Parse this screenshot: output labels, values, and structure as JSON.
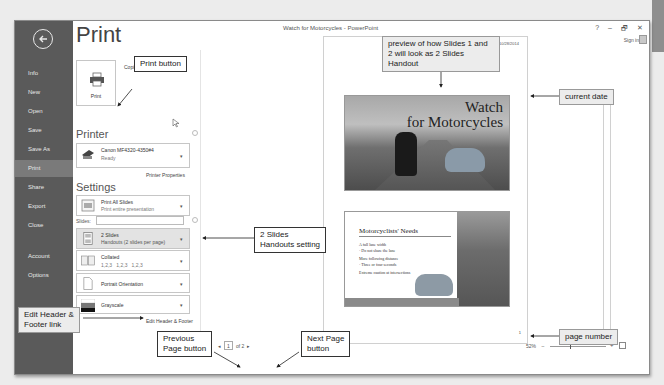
{
  "window": {
    "title": "Watch for Motorcycles - PowerPoint",
    "controls": [
      "?",
      "–",
      "🗗",
      "✕"
    ],
    "sign_in": "Sign in"
  },
  "sidebar": {
    "items": [
      {
        "label": "Info"
      },
      {
        "label": "New"
      },
      {
        "label": "Open"
      },
      {
        "label": "Save"
      },
      {
        "label": "Save As"
      },
      {
        "label": "Print",
        "active": true
      },
      {
        "label": "Share"
      },
      {
        "label": "Export"
      },
      {
        "label": "Close"
      },
      {
        "label": "Account"
      },
      {
        "label": "Options"
      }
    ]
  },
  "print": {
    "title": "Print",
    "button_label": "Print",
    "copies_label": "Copies:",
    "copies_value": "1"
  },
  "printer": {
    "heading": "Printer",
    "name": "Canon MF4320-4350#4",
    "status": "Ready",
    "properties_link": "Printer Properties"
  },
  "settings": {
    "heading": "Settings",
    "print_range": {
      "title": "Print All Slides",
      "subtitle": "Print entire presentation"
    },
    "slides_label": "Slides:",
    "slides_value": "",
    "layout": {
      "title": "2 Slides",
      "subtitle": "Handouts (2 slides per page)"
    },
    "collation": {
      "title": "Collated",
      "subtitle": "1,2,3   1,2,3   1,2,3"
    },
    "orientation": "Portrait Orientation",
    "color": "Grayscale",
    "header_footer_link": "Edit Header & Footer"
  },
  "preview": {
    "date": "10/28/2014",
    "slide1_title_line1": "Watch",
    "slide1_title_line2": "for Motorcycles",
    "slide2_title": "Motorcyclists' Needs",
    "slide2_bullets": [
      "A full lane width",
      "· Do not share the lane",
      "More following distance",
      "· Three or four seconds",
      "Extreme caution at intersections"
    ],
    "page_number": "1"
  },
  "pager": {
    "prev": "◂",
    "current": "1",
    "of_label": "of 2",
    "next": "▸"
  },
  "zoom": {
    "level": "52%",
    "minus": "–",
    "plus": "+"
  },
  "callouts": {
    "print_button": "Print button",
    "preview": "preview of how Slides 1 and 2 will look as 2 Slides Handout",
    "current_date": "current date",
    "handouts_setting_line1": "2 Slides",
    "handouts_setting_line2": "Handouts setting",
    "edit_header_line1": "Edit Header &",
    "edit_header_line2": "Footer link",
    "previous_page_line1": "Previous",
    "previous_page_line2": "Page button",
    "next_page_line1": "Next Page",
    "next_page_line2": "button",
    "page_number": "page number"
  }
}
